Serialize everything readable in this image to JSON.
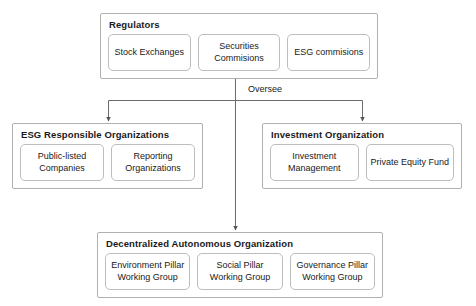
{
  "diagram": {
    "type": "organization-hierarchy",
    "edge_labels": {
      "oversee": "Oversee"
    },
    "colors": {
      "group_border": "#b0b0b0",
      "leaf_border": "#bdbdbd",
      "connector": "#6b6b6b",
      "text": "#1a1a1a",
      "background": "#ffffff"
    },
    "nodes": [
      {
        "id": "regulators",
        "title": "Regulators",
        "children": [
          {
            "label": "Stock Exchanges"
          },
          {
            "label": "Securities Commisions"
          },
          {
            "label": "ESG commisions"
          }
        ]
      },
      {
        "id": "esg-responsible-organizations",
        "title": "ESG Responsible Organizations",
        "children": [
          {
            "label": "Public-listed Companies"
          },
          {
            "label": "Reporting Organizations"
          }
        ]
      },
      {
        "id": "investment-organization",
        "title": "Investment Organization",
        "children": [
          {
            "label": "Investment Management"
          },
          {
            "label": "Private Equity Fund"
          }
        ]
      },
      {
        "id": "decentralized-autonomous-organization",
        "title": "Decentralized Autonomous Organization",
        "children": [
          {
            "label": "Environment Pillar Working Group"
          },
          {
            "label": "Social Pillar Working Group"
          },
          {
            "label": "Governance Pillar Working Group"
          }
        ]
      }
    ],
    "edges": [
      {
        "from": "regulators",
        "to": "esg-responsible-organizations",
        "label": "Oversee"
      },
      {
        "from": "regulators",
        "to": "investment-organization",
        "label": "Oversee"
      },
      {
        "from": "regulators",
        "to": "decentralized-autonomous-organization",
        "label": "Oversee"
      }
    ]
  }
}
